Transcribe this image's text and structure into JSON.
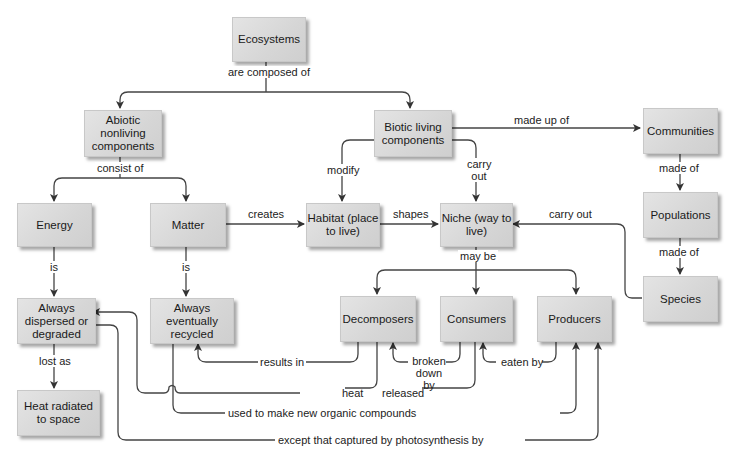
{
  "diagram": {
    "type": "concept-map",
    "nodes": {
      "ecosystems": "Ecosystems",
      "abiotic": "Abiotic nonliving components",
      "biotic": "Biotic living components",
      "energy": "Energy",
      "matter": "Matter",
      "habitat": "Habitat (place to live)",
      "niche": "Niche (way to live)",
      "communities": "Communities",
      "populations": "Populations",
      "species": "Species",
      "dispersed": "Always dispersed or degraded",
      "recycled": "Always eventually recycled",
      "decomposers": "Decomposers",
      "consumers": "Consumers",
      "producers": "Producers",
      "heat_space": "Heat radiated to space"
    },
    "edges": {
      "are_composed_of": "are composed of",
      "consist_of": "consist of",
      "made_up_of": "made up of",
      "modify": "modify",
      "carry_out_1": "carry out",
      "creates": "creates",
      "shapes": "shapes",
      "carry_out_2": "carry out",
      "made_of_1": "made of",
      "made_of_2": "made of",
      "is_1": "is",
      "is_2": "is",
      "may_be": "may be",
      "lost_as": "lost as",
      "results_in": "results in",
      "broken_down_by": "broken down by",
      "eaten_by": "eaten by",
      "heat": "heat",
      "released": "released",
      "used_to_make": "used to make new organic compounds",
      "except_captured": "except that captured by photosynthesis by"
    }
  }
}
